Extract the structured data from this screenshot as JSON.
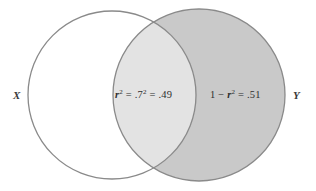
{
  "figure": {
    "type": "venn-diagram",
    "width": 316,
    "height": 191,
    "background_color": "#ffffff"
  },
  "sets": {
    "left": {
      "label": "X",
      "fill_color": "#ffffff",
      "stroke_color": "#8a8a8a",
      "center_x": 112,
      "center_y": 95,
      "radius": 84
    },
    "right": {
      "label": "Y",
      "fill_color": "#c9c9c9",
      "stroke_color": "#8a8a8a",
      "center_x": 199,
      "center_y": 95,
      "radius": 86
    }
  },
  "regions": {
    "intersection": {
      "fill_color": "#e3e3e3",
      "text_parts": {
        "var": "r",
        "exp": "2",
        "mid": " = .7",
        "exp2": "2",
        "tail": " = .49"
      },
      "plain_text": "r2 = .72 = .49",
      "value": 0.49
    },
    "right_only": {
      "fill_color": "#c9c9c9",
      "text_parts": {
        "lead": "1 − ",
        "var": "r",
        "exp": "2",
        "tail": " = .51"
      },
      "plain_text": "1 − r2 = .51",
      "value": 0.51
    }
  },
  "correlation": {
    "r": 0.7,
    "r_squared": 0.49,
    "unexplained": 0.51
  }
}
